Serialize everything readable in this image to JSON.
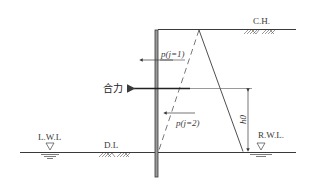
{
  "diagram": {
    "type": "sheet-pile-wall-pressure-diagram",
    "labels": {
      "crest_height": "C.H.",
      "left_water_level": "L.W.L",
      "dredge_level": "D.L",
      "right_water_level": "R.W.L.",
      "pressure_case_1": "p(j=1)",
      "pressure_case_2": "p(j=2)",
      "resultant_force": "合力",
      "height_h0": "h0"
    },
    "colors": {
      "line": "#3a3a3a",
      "wall_fill": "#9a9a9a",
      "background": "#ffffff"
    }
  }
}
